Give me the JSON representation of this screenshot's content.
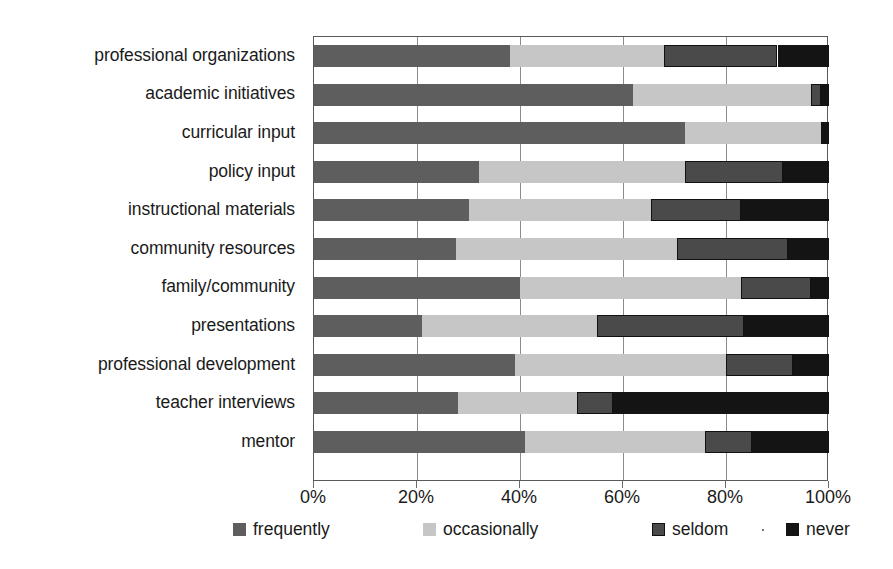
{
  "chart_data": {
    "type": "bar",
    "orientation": "horizontal",
    "stacked": true,
    "stack_mode": "percent",
    "title": "",
    "subtitle": "",
    "xlabel": "",
    "ylabel": "",
    "xlim": [
      0,
      100
    ],
    "x_tick_labels": [
      "0%",
      "20%",
      "40%",
      "60%",
      "80%",
      "100%"
    ],
    "x_tick_values": [
      0,
      20,
      40,
      60,
      80,
      100
    ],
    "grid": true,
    "grid_axis": "x",
    "legend_position": "bottom",
    "legend_entries": [
      "frequently",
      "occasionally",
      "seldom",
      "never"
    ],
    "categories": [
      "professional organizations",
      "academic initiatives",
      "curricular input",
      "policy input",
      "instructional materials",
      "community resources",
      "family/community",
      "presentations",
      "professional development",
      "teacher interviews",
      "mentor"
    ],
    "series": [
      {
        "name": "frequently",
        "color": "#5e5e5e",
        "values": [
          38,
          62,
          72,
          32,
          30,
          27.5,
          40,
          21,
          39,
          28,
          41
        ]
      },
      {
        "name": "occasionally",
        "color": "#c6c6c6",
        "values": [
          30,
          34.5,
          26.5,
          40,
          35.5,
          43,
          43,
          34,
          41,
          23,
          35
        ]
      },
      {
        "name": "seldom",
        "color": "#4a4a4a",
        "values": [
          22,
          2,
          0,
          19,
          17.5,
          21.5,
          13.5,
          28.5,
          13,
          7,
          9
        ]
      },
      {
        "name": "never",
        "color": "#141414",
        "values": [
          10,
          1.5,
          1.5,
          9,
          17,
          8,
          3.5,
          16.5,
          7,
          42,
          15
        ]
      }
    ]
  },
  "colors": {
    "frequently": "#5e5e5e",
    "occasionally": "#c6c6c6",
    "seldom": "#4a4a4a",
    "never": "#141414",
    "axis": "#5a5a5a",
    "grid": "#8c8c8c",
    "text": "#1a1a1a",
    "background": "#ffffff"
  }
}
